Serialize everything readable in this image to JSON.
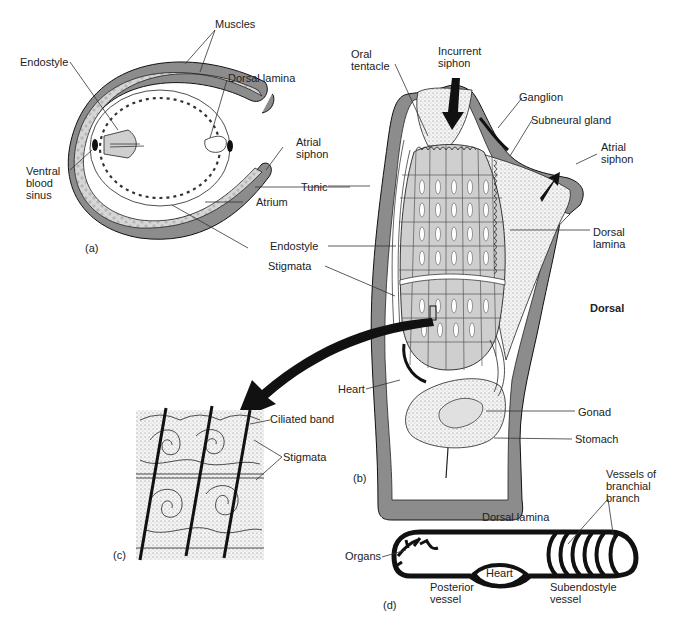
{
  "figure": {
    "panels": {
      "a": {
        "tag": "(a)",
        "labels": {
          "muscles": "Muscles",
          "endostyle": "Endostyle",
          "dorsal_lamina": "Dorsal lamina",
          "atrial_siphon_1": "Atrial",
          "atrial_siphon_2": "siphon",
          "ventral_1": "Ventral",
          "ventral_2": "blood",
          "ventral_3": "sinus",
          "tunic": "Tunic",
          "atrium": "Atrium"
        }
      },
      "b": {
        "tag": "(b)",
        "labels": {
          "oral_1": "Oral",
          "oral_2": "tentacle",
          "incurrent_1": "Incurrent",
          "incurrent_2": "siphon",
          "ganglion": "Ganglion",
          "subneural_gland": "Subneural gland",
          "atrial_1": "Atrial",
          "atrial_2": "siphon",
          "dorsal_lamina_1": "Dorsal",
          "dorsal_lamina_2": "lamina",
          "endostyle": "Endostyle",
          "stigmata": "Stigmata",
          "dorsal": "Dorsal",
          "heart": "Heart",
          "gonad": "Gonad",
          "stomach": "Stomach"
        }
      },
      "c": {
        "tag": "(c)",
        "labels": {
          "ciliated_band": "Ciliated band",
          "stigmata": "Stigmata"
        }
      },
      "d": {
        "tag": "(d)",
        "labels": {
          "vessels_1": "Vessels of",
          "vessels_2": "branchial",
          "vessels_3": "branch",
          "dorsal_lamina": "Dorsal lamina",
          "organs": "Organs",
          "heart": "Heart",
          "posterior_1": "Posterior",
          "posterior_2": "vessel",
          "subendostyle_1": "Subendostyle",
          "subendostyle_2": "vessel"
        }
      }
    },
    "colors": {
      "tunic_gray": "#8c8c8c",
      "tissue_light": "#d4d4d4",
      "stipple": "#efefef",
      "ink": "#111111"
    }
  }
}
